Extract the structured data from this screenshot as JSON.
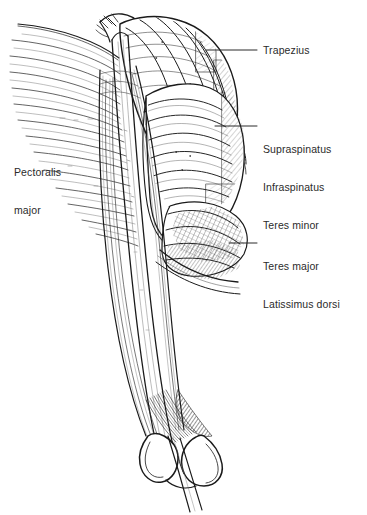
{
  "figure": {
    "view": "right shoulder, posterolateral view",
    "style": "black-and-white pen-and-ink line art with hatching",
    "background_color": "#ffffff",
    "ink_color": "#1a1a1a",
    "text_color": "#2b2b2b"
  },
  "labels": [
    {
      "id": "trapezius",
      "lines": [
        "Trapezius"
      ],
      "text_x": 263,
      "text_y": 44,
      "leader": {
        "x1": 206,
        "y1": 50,
        "x2": 257,
        "y2": 50
      }
    },
    {
      "id": "rotator-cuff",
      "lines": [
        "Supraspinatus",
        "Infraspinatus",
        "Teres minor"
      ],
      "text_x": 263,
      "text_y": 118,
      "leader": {
        "x1": 215,
        "y1": 126,
        "x2": 257,
        "y2": 126
      }
    },
    {
      "id": "teres-latissimus",
      "lines": [
        "Teres major",
        "Latissimus dorsi"
      ],
      "text_x": 263,
      "text_y": 235,
      "leader": {
        "x1": 229,
        "y1": 243,
        "x2": 257,
        "y2": 243
      }
    },
    {
      "id": "pectoralis-major",
      "lines": [
        "Pectoralis",
        "major"
      ],
      "text_x": 14,
      "text_y": 141,
      "leader": null
    }
  ],
  "label_text": {
    "trapezius_l1": "Trapezius",
    "rotator_l1": "Supraspinatus",
    "rotator_l2": "Infraspinatus",
    "rotator_l3": "Teres minor",
    "teres_l1": "Teres major",
    "teres_l2": "Latissimus dorsi",
    "pectoralis_l1": "Pectoralis",
    "pectoralis_l2": "major"
  },
  "structures": [
    "trapezius",
    "deltoid",
    "supraspinatus",
    "infraspinatus",
    "teres minor",
    "teres major",
    "latissimus dorsi",
    "pectoralis major",
    "biceps brachii",
    "triceps brachii",
    "humerus",
    "clavicle",
    "acromion",
    "medial epicondyle",
    "lateral epicondyle"
  ]
}
